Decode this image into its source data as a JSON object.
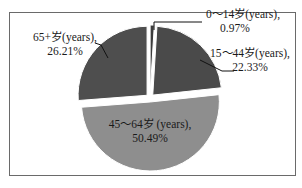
{
  "chart_data": {
    "type": "pie",
    "title": "",
    "slices": [
      {
        "label": "0～14岁(years)",
        "value": 0.97,
        "pct_text": "0.97%",
        "color": "#3c3c3c"
      },
      {
        "label": "15～44岁(years)",
        "value": 22.33,
        "pct_text": "22.33%",
        "color": "#4a4a4a"
      },
      {
        "label": "45～64岁 (years)",
        "value": 50.49,
        "pct_text": "50.49%",
        "color": "#8e8e8e"
      },
      {
        "label": "65+岁(years)",
        "value": 26.21,
        "pct_text": "26.21%",
        "color": "#4e4e4e"
      }
    ],
    "exploded": true,
    "legend": "none"
  }
}
